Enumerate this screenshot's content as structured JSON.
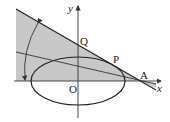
{
  "diagram": {
    "type": "geometry",
    "labels": {
      "x_axis": "x",
      "y_axis": "y",
      "origin": "O",
      "point_q": "Q",
      "point_p": "P",
      "point_a": "A"
    },
    "colors": {
      "shade": "#c8c8c8",
      "line": "#333333",
      "background": "#ffffff"
    }
  }
}
